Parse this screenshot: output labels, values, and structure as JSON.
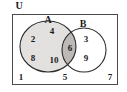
{
  "diagram": {
    "type": "venn-two-set",
    "universe_label": "U",
    "set_a_label": "A",
    "set_b_label": "B",
    "colors": {
      "background": "#ffffff",
      "stroke": "#2b2b2b",
      "set_a_fill": "#e3e1df",
      "intersection_fill": "#bcb9b6",
      "set_b_fill": "#ffffff",
      "text": "#1a1a1a"
    },
    "regions": {
      "a_only": [
        "2",
        "4",
        "8",
        "10"
      ],
      "intersection": [
        "6"
      ],
      "b_only": [
        "3",
        "9"
      ],
      "outside": [
        "1",
        "5",
        "7"
      ]
    },
    "elements": [
      {
        "value": "2",
        "region": "a-only",
        "x": 33,
        "y": 40
      },
      {
        "value": "4",
        "region": "a-only",
        "x": 52,
        "y": 32
      },
      {
        "value": "8",
        "region": "a-only",
        "x": 33,
        "y": 59
      },
      {
        "value": "10",
        "region": "a-only",
        "x": 54,
        "y": 61
      },
      {
        "value": "6",
        "region": "intersection",
        "x": 70,
        "y": 49
      },
      {
        "value": "3",
        "region": "b-only",
        "x": 86,
        "y": 40
      },
      {
        "value": "9",
        "region": "b-only",
        "x": 86,
        "y": 59
      },
      {
        "value": "1",
        "region": "outside",
        "x": 21,
        "y": 78
      },
      {
        "value": "5",
        "region": "outside",
        "x": 65,
        "y": 78
      },
      {
        "value": "7",
        "region": "outside",
        "x": 110,
        "y": 78
      }
    ]
  }
}
